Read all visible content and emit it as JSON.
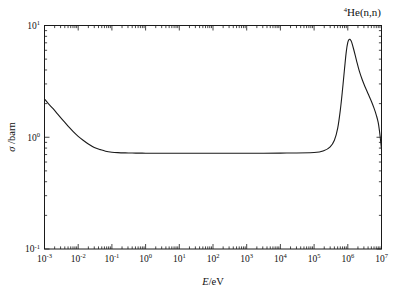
{
  "chart_data": {
    "type": "line",
    "title": "4He(n,n)",
    "title_parts": {
      "superscript": "4",
      "rest": "He(n,n)"
    },
    "xlabel": "E/eV",
    "xlabel_parts": {
      "italic": "E",
      "rest": "/eV"
    },
    "ylabel": "σ /barn",
    "ylabel_parts": {
      "symbol": "σ",
      "rest": " /barn"
    },
    "xscale": "log",
    "yscale": "log",
    "xlim": [
      0.001,
      10000000
    ],
    "ylim": [
      0.1,
      10
    ],
    "xtick_labels": [
      "10-3",
      "10-2",
      "10-1",
      "100",
      "101",
      "102",
      "103",
      "104",
      "105",
      "106",
      "107"
    ],
    "xtick_exponents": [
      "-3",
      "-2",
      "-1",
      "0",
      "1",
      "2",
      "3",
      "4",
      "5",
      "6",
      "7"
    ],
    "ytick_exponents": [
      "1",
      "0",
      "-1"
    ],
    "grid": false,
    "legend": null,
    "line_color": "#1a1a1a",
    "line_width": 1.1,
    "series": [
      {
        "name": "4He(n,n) elastic cross section",
        "x": [
          0.001,
          0.0013,
          0.0018,
          0.0025,
          0.0035,
          0.005,
          0.007,
          0.01,
          0.014,
          0.02,
          0.03,
          0.045,
          0.065,
          0.1,
          0.15,
          0.25,
          0.4,
          0.7,
          1,
          3,
          10,
          100,
          1000,
          10000,
          100000,
          200000,
          300000,
          400000,
          500000,
          600000,
          700000,
          800000,
          900000,
          1000000,
          1100000,
          1200000,
          1300000,
          1500000,
          1800000,
          2200000,
          2700000,
          3300000,
          4000000,
          5000000,
          6000000,
          7000000,
          8000000,
          9000000,
          10000000
        ],
        "y": [
          2.2,
          2.0,
          1.8,
          1.6,
          1.42,
          1.26,
          1.13,
          1.02,
          0.94,
          0.87,
          0.81,
          0.775,
          0.75,
          0.735,
          0.728,
          0.724,
          0.722,
          0.721,
          0.72,
          0.72,
          0.72,
          0.72,
          0.72,
          0.721,
          0.73,
          0.76,
          0.82,
          0.94,
          1.2,
          1.75,
          2.7,
          4.1,
          5.8,
          7.05,
          7.5,
          7.45,
          7.1,
          6.1,
          4.9,
          3.9,
          3.25,
          2.8,
          2.45,
          2.1,
          1.82,
          1.58,
          1.35,
          1.05,
          0.78
        ],
        "peak": {
          "x": 1100000,
          "y": 7.5
        },
        "plateau_value": 0.72,
        "start_value": 2.2,
        "end_value": 0.78
      }
    ]
  }
}
